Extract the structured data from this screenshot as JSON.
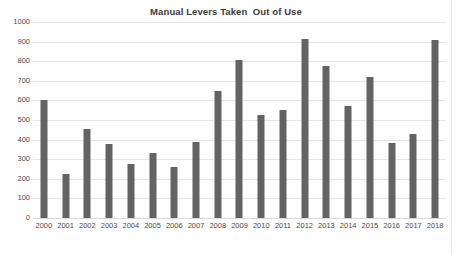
{
  "chart_data": {
    "type": "bar",
    "title": "Manual Levers Taken  Out of Use",
    "xlabel": "",
    "ylabel": "",
    "ylim": [
      0,
      1000
    ],
    "ytick_step": 100,
    "ytick_labels": [
      "0",
      "100",
      "200",
      "300",
      "400",
      "500",
      "600",
      "700",
      "800",
      "900",
      "1000"
    ],
    "ytick_values": [
      0,
      100,
      200,
      300,
      400,
      500,
      600,
      700,
      800,
      900,
      1000
    ],
    "grid": true,
    "grid_axis": "y",
    "legend": false,
    "legend_position": "none",
    "bar_color": "#636363",
    "grid_color": "#e4e4e4",
    "background_color": "#ffffff",
    "text_color": "#4a4a4a",
    "title_color": "#3a3a3a",
    "categories": [
      "2000",
      "2001",
      "2002",
      "2003",
      "2004",
      "2005",
      "2006",
      "2007",
      "2008",
      "2009",
      "2010",
      "2011",
      "2012",
      "2013",
      "2014",
      "2015",
      "2016",
      "2017",
      "2018"
    ],
    "values": [
      600,
      225,
      452,
      380,
      278,
      333,
      262,
      388,
      648,
      808,
      525,
      552,
      915,
      777,
      572,
      717,
      385,
      428,
      910
    ]
  }
}
